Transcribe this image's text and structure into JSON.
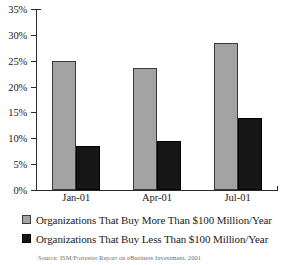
{
  "chart_data": {
    "type": "bar",
    "title": "",
    "xlabel": "",
    "ylabel": "",
    "categories": [
      "Jan-01",
      "Apr-01",
      "Jul-01"
    ],
    "series": [
      {
        "name": "Organizations That Buy More Than $100 Million/Year",
        "color": "#a3a3a3",
        "values": [
          25.0,
          23.5,
          28.5
        ]
      },
      {
        "name": "Organizations That Buy Less Than $100 Million/Year",
        "color": "#161616",
        "values": [
          8.5,
          9.5,
          14.0
        ]
      }
    ],
    "ylim": [
      0,
      35
    ],
    "y_ticks": [
      0,
      5,
      10,
      15,
      20,
      25,
      30,
      35
    ],
    "y_tick_labels": [
      "0%",
      "5%",
      "10%",
      "15%",
      "20%",
      "25%",
      "30%",
      "35%"
    ],
    "grid": false,
    "legend_position": "bottom"
  },
  "legend": {
    "items": [
      {
        "label": "Organizations That Buy More Than $100 Million/Year",
        "swatch": "more"
      },
      {
        "label": "Organizations That Buy Less Than $100 Million/Year",
        "swatch": "less"
      }
    ]
  },
  "source": {
    "text": "Source: ISM/Forrester Report on eBusiness Investment, 2001"
  }
}
